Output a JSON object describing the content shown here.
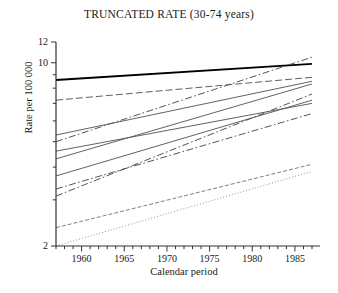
{
  "chart_data": {
    "type": "line",
    "title": "TRUNCATED RATE (30-74 years)",
    "xlabel": "Calendar period",
    "ylabel": "Rate per 100 000",
    "yscale": "log",
    "ylim": [
      2,
      12
    ],
    "xlim": [
      1957,
      1987
    ],
    "grid": false,
    "legend": "none",
    "yticks_labeled": [
      "12",
      "10",
      "2"
    ],
    "yticks_minor": [
      "9",
      "8",
      "7",
      "6",
      "5",
      "4",
      "3"
    ],
    "xticks_labeled": [
      "1960",
      "1965",
      "1970",
      "1975",
      "1980",
      "1985"
    ],
    "xticks_minor_step": 1,
    "x": [
      1957,
      1987
    ],
    "series": [
      {
        "name": "series-1",
        "style": "solid-thick",
        "color": "#000000",
        "values": [
          8.6,
          9.9
        ]
      },
      {
        "name": "series-2",
        "style": "dash-dot",
        "color": "#4a4a4a",
        "values": [
          5.0,
          10.5
        ]
      },
      {
        "name": "series-3",
        "style": "long-dash",
        "color": "#555555",
        "values": [
          7.2,
          8.8
        ]
      },
      {
        "name": "series-4",
        "style": "solid",
        "color": "#5a5a5a",
        "values": [
          5.3,
          8.5
        ]
      },
      {
        "name": "series-5",
        "style": "solid",
        "color": "#5a5a5a",
        "values": [
          4.3,
          8.3
        ]
      },
      {
        "name": "series-6",
        "style": "solid",
        "color": "#5a5a5a",
        "values": [
          4.6,
          7.0
        ]
      },
      {
        "name": "series-7",
        "style": "solid",
        "color": "#5a5a5a",
        "values": [
          3.7,
          7.2
        ]
      },
      {
        "name": "series-8",
        "style": "dash-dot",
        "color": "#4a4a4a",
        "values": [
          3.1,
          7.6
        ]
      },
      {
        "name": "series-9",
        "style": "dash-dot",
        "color": "#4a4a4a",
        "values": [
          3.3,
          6.4
        ]
      },
      {
        "name": "series-10",
        "style": "dashed-fine",
        "color": "#707070",
        "values": [
          2.35,
          4.1
        ]
      },
      {
        "name": "series-11",
        "style": "dotted",
        "color": "#8a8a8a",
        "values": [
          2.0,
          3.85
        ]
      }
    ]
  }
}
